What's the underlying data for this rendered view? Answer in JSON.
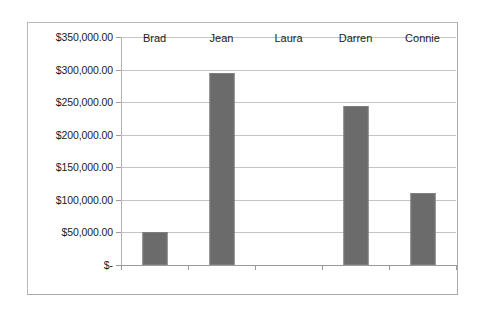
{
  "chart_data": {
    "type": "bar",
    "title": "",
    "xlabel": "",
    "ylabel": "",
    "categories": [
      "Brad",
      "Jean",
      "Laura",
      "Darren",
      "Connie"
    ],
    "values": [
      51000,
      295000,
      0,
      244000,
      111000
    ],
    "series": [
      {
        "name": "",
        "values": [
          51000,
          295000,
          0,
          244000,
          111000
        ]
      }
    ],
    "ylim": [
      0,
      350000
    ],
    "ytick_values": [
      0,
      50000,
      100000,
      150000,
      200000,
      250000,
      300000,
      350000
    ],
    "ytick_labels": [
      "$-",
      "$50,000.00",
      "$100,000.00",
      "$150,000.00",
      "$200,000.00",
      "$250,000.00",
      "$300,000.00",
      "$350,000.00"
    ],
    "grid": true,
    "grid_axis": "y",
    "legend": false,
    "legend_position": "none",
    "bar_color": "#6b6b6b",
    "gridline_color": "#c4c4c4",
    "axis_color": "#9a9a9a",
    "plot_background": "#ffffff",
    "frame_border_color": "#b9b9b9",
    "shadow_color": "#111111"
  }
}
